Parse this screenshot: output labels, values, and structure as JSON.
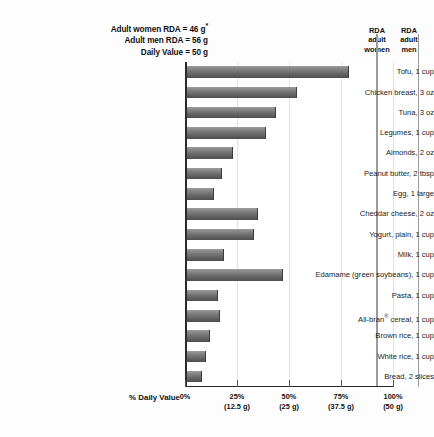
{
  "header": {
    "lines": [
      "Adult women RDA = 46 g",
      "Adult men RDA = 56 g",
      "Daily Value = 50 g"
    ],
    "asterisk": "*"
  },
  "reference_labels": {
    "women": [
      "RDA",
      "adult",
      "women"
    ],
    "men": [
      "RDA",
      "adult",
      "men"
    ]
  },
  "axis_title": "% Daily Value",
  "chart_data": {
    "type": "bar",
    "orientation": "horizontal",
    "title": "",
    "subtitle": "",
    "xlabel": "% Daily Value",
    "ylabel": "",
    "xlim": [
      0,
      112
    ],
    "grid": true,
    "legend": false,
    "categories": [
      "Tofu, 1 cup",
      "Chicken breast, 3 oz",
      "Tuna, 3 oz",
      "Legumes, 1 cup",
      "Almonds, 2 oz",
      "Peanut butter, 2 tbsp",
      "Egg, 1 large",
      "Cheddar cheese, 2 oz",
      "Yogurt, plain, 1 cup",
      "Milk, 1 cup",
      "Edamame (green soybeans), 1 cup",
      "Pasta, 1 cup",
      "All-bran® cereal, 1 cup",
      "Brown rice, 1 cup",
      "White rice, 1 cup",
      "Bread, 2 slices"
    ],
    "values": [
      78,
      53,
      43,
      38,
      22,
      17,
      13,
      34,
      32,
      18,
      46,
      15,
      16,
      11,
      9,
      7
    ],
    "tick_values": [
      0,
      25,
      50,
      75,
      100
    ],
    "tick_labels": [
      "0%",
      "25%",
      "50%",
      "75%",
      "100%"
    ],
    "tick_sublabels": [
      "",
      "(12.5 g)",
      "(25 g)",
      "(37.5 g)",
      "(50 g)"
    ],
    "reference_lines": [
      {
        "name": "RDA adult women",
        "value": 92
      },
      {
        "name": "RDA adult men",
        "value": 112
      }
    ],
    "colors": {
      "bar_top": "#9d9d9d",
      "bar_bottom": "#4e4e4e",
      "axis": "#2b2b2b",
      "grid": "#e2e2e2",
      "reference_line": "#9a9a9a",
      "text": "#111111",
      "background": "#fdfdfd"
    }
  }
}
